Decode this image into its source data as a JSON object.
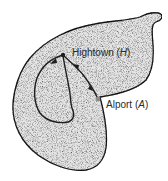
{
  "diagram": {
    "type": "map-illustration",
    "colors": {
      "land_fill": "#e4e4e4",
      "outline": "#1e1e1e",
      "background": "#ffffff"
    },
    "places": [
      {
        "name": "Hightown",
        "abbr": "H",
        "point": [
          63,
          55
        ]
      },
      {
        "name": "Alport",
        "abbr": "A",
        "point": [
          98,
          99
        ]
      }
    ],
    "labels": {
      "hightown_name": "Hightown",
      "hightown_abbr": "H",
      "alport_name": "Alport",
      "alport_abbr": "A"
    },
    "routes": [
      {
        "id": "loop",
        "description": "Closed loop route starting and ending at Hightown"
      },
      {
        "id": "link",
        "description": "Route between Hightown and Alport with arrows"
      }
    ]
  }
}
